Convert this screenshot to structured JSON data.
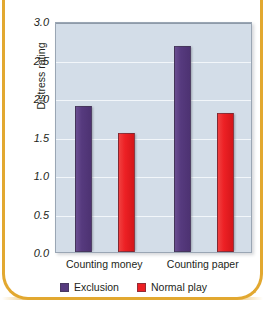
{
  "chart_data": {
    "type": "bar",
    "title": "",
    "xlabel": "",
    "ylabel": "Distress rating",
    "ylim": [
      0.0,
      3.0
    ],
    "ytick_labels": [
      "3.0",
      "2.5",
      "2.0",
      "1.5",
      "1.0",
      "0.5",
      "0.0"
    ],
    "ytick_values": [
      3.0,
      2.5,
      2.0,
      1.5,
      1.0,
      0.5,
      0.0
    ],
    "grid": true,
    "legend_position": "bottom-center",
    "categories": [
      "Counting money",
      "Counting paper"
    ],
    "series": [
      {
        "name": "Exclusion",
        "color": "#563a7e",
        "values": [
          1.9,
          2.68
        ]
      },
      {
        "name": "Normal play",
        "color": "#ed2024",
        "values": [
          1.55,
          1.81
        ]
      }
    ],
    "plot_background": "#d3dde8",
    "gridline_color": "#f2f6fa",
    "frame_color": "#e2a830"
  },
  "figure": {
    "title_clipped": "",
    "y_axis_title": "Distress rating"
  }
}
